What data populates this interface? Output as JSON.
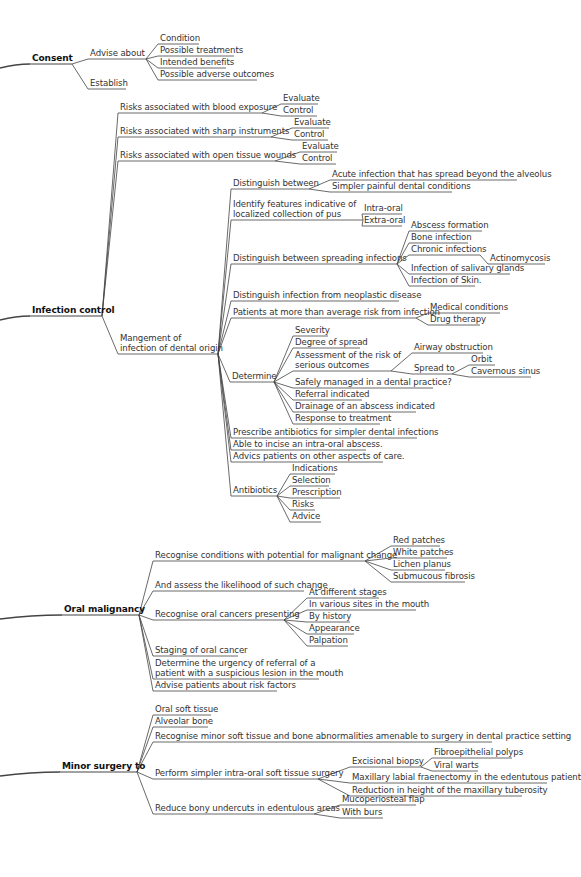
{
  "diagram": {
    "type": "mind-map",
    "colors": {
      "line": "#444444",
      "text": "#333333",
      "root_text": "#111111",
      "background": "#ffffff"
    },
    "nodes": [
      {
        "id": "consent",
        "text": "Consent",
        "x": 32,
        "y": 64,
        "w": 36,
        "root": true,
        "parent": null
      },
      {
        "id": "advise",
        "text": "Advise about",
        "x": 90,
        "y": 59,
        "w": 52,
        "parent": "consent"
      },
      {
        "id": "establish",
        "text": "Establish",
        "x": 90,
        "y": 89,
        "w": 32,
        "parent": "consent"
      },
      {
        "id": "cond",
        "text": "Condition",
        "x": 160,
        "y": 44,
        "w": 35,
        "parent": "advise"
      },
      {
        "id": "treat",
        "text": "Possible treatments",
        "x": 160,
        "y": 56,
        "w": 70,
        "parent": "advise"
      },
      {
        "id": "bene",
        "text": "Intended benefits",
        "x": 160,
        "y": 68,
        "w": 62,
        "parent": "advise"
      },
      {
        "id": "adv",
        "text": "Possible adverse outcomes",
        "x": 160,
        "y": 80,
        "w": 93,
        "parent": "advise"
      },
      {
        "id": "ic",
        "text": "Infection control",
        "x": 32,
        "y": 316,
        "w": 66,
        "root": true,
        "parent": null
      },
      {
        "id": "blood",
        "text": "Risks associated with blood exposure",
        "x": 120,
        "y": 113,
        "w": 138,
        "parent": "ic"
      },
      {
        "id": "blood_e",
        "text": "Evaluate",
        "x": 283,
        "y": 104,
        "w": 31,
        "parent": "blood"
      },
      {
        "id": "blood_c",
        "text": "Control",
        "x": 283,
        "y": 116,
        "w": 30,
        "parent": "blood"
      },
      {
        "id": "sharp",
        "text": "Risks associated with sharp instruments",
        "x": 120,
        "y": 137,
        "w": 147,
        "parent": "ic"
      },
      {
        "id": "sharp_e",
        "text": "Evaluate",
        "x": 294,
        "y": 128,
        "w": 31,
        "parent": "sharp"
      },
      {
        "id": "sharp_c",
        "text": "Control",
        "x": 294,
        "y": 140,
        "w": 30,
        "parent": "sharp"
      },
      {
        "id": "open",
        "text": "Risks associated with open tissue wounds",
        "x": 120,
        "y": 161,
        "w": 151,
        "parent": "ic"
      },
      {
        "id": "open_e",
        "text": "Evaluate",
        "x": 302,
        "y": 152,
        "w": 31,
        "parent": "open"
      },
      {
        "id": "open_c",
        "text": "Control",
        "x": 302,
        "y": 164,
        "w": 30,
        "parent": "open"
      },
      {
        "id": "mgmt",
        "text": "Mangement of\ninfection of dental origin",
        "x": 120,
        "y": 354,
        "w": 94,
        "parent": "ic",
        "lines": 2
      },
      {
        "id": "dist",
        "text": "Distinguish between",
        "x": 233,
        "y": 189,
        "w": 72,
        "parent": "mgmt"
      },
      {
        "id": "acute",
        "text": "Acute infection that has spread beyond the alveolus",
        "x": 332,
        "y": 180,
        "w": 181,
        "parent": "dist"
      },
      {
        "id": "simpler",
        "text": "Simpler painful dental conditions",
        "x": 332,
        "y": 192,
        "w": 116,
        "parent": "dist"
      },
      {
        "id": "ident",
        "text": "Identify features indicative of\nlocalized collection of pus",
        "x": 233,
        "y": 220,
        "w": 126,
        "parent": "mgmt",
        "lines": 2
      },
      {
        "id": "intra",
        "text": "Intra-oral",
        "x": 364,
        "y": 214,
        "w": 34,
        "parent": "ident"
      },
      {
        "id": "extra",
        "text": "Extra-oral",
        "x": 364,
        "y": 226,
        "w": 34,
        "parent": "ident"
      },
      {
        "id": "spread",
        "text": "Distinguish between spreading infections",
        "x": 233,
        "y": 264,
        "w": 160,
        "parent": "mgmt"
      },
      {
        "id": "absc",
        "text": "Abscess formation",
        "x": 411,
        "y": 231,
        "w": 67,
        "parent": "spread"
      },
      {
        "id": "bone",
        "text": "Bone infection",
        "x": 411,
        "y": 243,
        "w": 53,
        "parent": "spread"
      },
      {
        "id": "chronic",
        "text": "Chronic infections",
        "x": 411,
        "y": 255,
        "w": 65,
        "parent": "spread"
      },
      {
        "id": "actino",
        "text": "Actinomycosis",
        "x": 490,
        "y": 264,
        "w": 51,
        "parent": "chronic"
      },
      {
        "id": "saliv",
        "text": "Infection of salivary glands",
        "x": 411,
        "y": 274,
        "w": 95,
        "parent": "spread"
      },
      {
        "id": "skin",
        "text": "Infection of Skin.",
        "x": 411,
        "y": 286,
        "w": 60,
        "parent": "spread"
      },
      {
        "id": "neo",
        "text": "Distinguish infection from neoplastic disease",
        "x": 233,
        "y": 301,
        "w": 162,
        "parent": "mgmt"
      },
      {
        "id": "risk",
        "text": "Patients at more than average risk from infection",
        "x": 233,
        "y": 318,
        "w": 179,
        "parent": "mgmt"
      },
      {
        "id": "med",
        "text": "Medical conditions",
        "x": 430,
        "y": 313,
        "w": 66,
        "parent": "risk"
      },
      {
        "id": "drug",
        "text": "Drug therapy",
        "x": 430,
        "y": 325,
        "w": 46,
        "parent": "risk"
      },
      {
        "id": "determ",
        "text": "Determine",
        "x": 232,
        "y": 382,
        "w": 38,
        "parent": "mgmt"
      },
      {
        "id": "sev",
        "text": "Severity",
        "x": 295,
        "y": 336,
        "w": 29,
        "parent": "determ"
      },
      {
        "id": "deg",
        "text": "Degree of spread",
        "x": 295,
        "y": 348,
        "w": 61,
        "parent": "determ"
      },
      {
        "id": "assess",
        "text": "Assessment of the risk of\nserious outcomes",
        "x": 295,
        "y": 371,
        "w": 92,
        "parent": "determ",
        "lines": 2
      },
      {
        "id": "airway",
        "text": "Airway obstruction",
        "x": 414,
        "y": 353,
        "w": 65,
        "parent": "assess"
      },
      {
        "id": "spreadto",
        "text": "Spread to",
        "x": 414,
        "y": 374,
        "w": 34,
        "parent": "assess"
      },
      {
        "id": "orbit",
        "text": "Orbit",
        "x": 471,
        "y": 365,
        "w": 20,
        "parent": "spreadto"
      },
      {
        "id": "cav",
        "text": "Cavernous sinus",
        "x": 471,
        "y": 377,
        "w": 56,
        "parent": "spreadto"
      },
      {
        "id": "safe",
        "text": "Safely managed in a dental practice?",
        "x": 295,
        "y": 388,
        "w": 134,
        "parent": "determ"
      },
      {
        "id": "refer",
        "text": "Referral indicated",
        "x": 295,
        "y": 400,
        "w": 63,
        "parent": "determ"
      },
      {
        "id": "drain",
        "text": "Drainage of an abscess indicated",
        "x": 295,
        "y": 412,
        "w": 117,
        "parent": "determ"
      },
      {
        "id": "resp",
        "text": "Response to treatment",
        "x": 295,
        "y": 424,
        "w": 81,
        "parent": "determ"
      },
      {
        "id": "presc",
        "text": "Prescribe antibiotics for simpler dental infections",
        "x": 233,
        "y": 438,
        "w": 180,
        "parent": "mgmt"
      },
      {
        "id": "incise",
        "text": "Able to incise an intra-oral abscess.",
        "x": 233,
        "y": 450,
        "w": 129,
        "parent": "mgmt"
      },
      {
        "id": "advice_c",
        "text": "Advics patients on other aspects of care.",
        "x": 233,
        "y": 462,
        "w": 146,
        "parent": "mgmt"
      },
      {
        "id": "antib",
        "text": "Antibiotics",
        "x": 233,
        "y": 496,
        "w": 40,
        "parent": "mgmt"
      },
      {
        "id": "ind",
        "text": "Indications",
        "x": 292,
        "y": 474,
        "w": 39,
        "parent": "antib"
      },
      {
        "id": "sel",
        "text": "Selection",
        "x": 292,
        "y": 486,
        "w": 33,
        "parent": "antib"
      },
      {
        "id": "pres2",
        "text": "Prescription",
        "x": 292,
        "y": 498,
        "w": 44,
        "parent": "antib"
      },
      {
        "id": "risks",
        "text": "Risks",
        "x": 292,
        "y": 510,
        "w": 19,
        "parent": "antib"
      },
      {
        "id": "advi",
        "text": "Advice",
        "x": 292,
        "y": 522,
        "w": 25,
        "parent": "antib"
      },
      {
        "id": "om",
        "text": "Oral malignancy",
        "x": 64,
        "y": 615,
        "w": 71,
        "root": true,
        "parent": null
      },
      {
        "id": "recog",
        "text": "Recognise conditions with potential for malignant change",
        "x": 155,
        "y": 561,
        "w": 206,
        "parent": "om"
      },
      {
        "id": "red",
        "text": "Red patches",
        "x": 393,
        "y": 546,
        "w": 43,
        "parent": "recog"
      },
      {
        "id": "white",
        "text": "White patches",
        "x": 393,
        "y": 558,
        "w": 50,
        "parent": "recog"
      },
      {
        "id": "lichen",
        "text": "Lichen planus",
        "x": 393,
        "y": 570,
        "w": 48,
        "parent": "recog"
      },
      {
        "id": "submuc",
        "text": "Submucous fibrosis",
        "x": 393,
        "y": 582,
        "w": 68,
        "parent": "recog"
      },
      {
        "id": "likeli",
        "text": "And assess the likelihood of such change",
        "x": 155,
        "y": 591,
        "w": 145,
        "parent": "om"
      },
      {
        "id": "recogcan",
        "text": "Recognise oral cancers presenting",
        "x": 155,
        "y": 620,
        "w": 125,
        "parent": "om"
      },
      {
        "id": "stages",
        "text": "At different stages",
        "x": 309,
        "y": 598,
        "w": 66,
        "parent": "recogcan"
      },
      {
        "id": "sites",
        "text": "In various sites in the mouth",
        "x": 309,
        "y": 610,
        "w": 103,
        "parent": "recogcan"
      },
      {
        "id": "hist",
        "text": "By history",
        "x": 309,
        "y": 622,
        "w": 37,
        "parent": "recogcan"
      },
      {
        "id": "appear",
        "text": "Appearance",
        "x": 309,
        "y": 634,
        "w": 41,
        "parent": "recogcan"
      },
      {
        "id": "palp",
        "text": "Palpation",
        "x": 309,
        "y": 646,
        "w": 35,
        "parent": "recogcan"
      },
      {
        "id": "staging",
        "text": "Staging of oral cancer",
        "x": 155,
        "y": 656,
        "w": 79,
        "parent": "om"
      },
      {
        "id": "urgency",
        "text": "Determine the urgency of referral of a\npatient with a suspicious lesion in the mouth",
        "x": 155,
        "y": 679,
        "w": 160,
        "parent": "om",
        "lines": 2
      },
      {
        "id": "riskf",
        "text": "Advise patients about risk factors",
        "x": 155,
        "y": 691,
        "w": 118,
        "parent": "om"
      },
      {
        "id": "ms",
        "text": "Minor surgery to",
        "x": 62,
        "y": 772,
        "w": 71,
        "root": true,
        "parent": null
      },
      {
        "id": "ost",
        "text": "Oral soft tissue",
        "x": 155,
        "y": 715,
        "w": 52,
        "parent": "ms"
      },
      {
        "id": "alv",
        "text": "Alveolar bone",
        "x": 155,
        "y": 727,
        "w": 49,
        "parent": "ms"
      },
      {
        "id": "recmin",
        "text": "Recognise minor soft tissue and bone abnormalities amenable to surgery in dental practice setting",
        "x": 155,
        "y": 742,
        "w": 333,
        "parent": "ms"
      },
      {
        "id": "perf",
        "text": "Perform simpler intra-oral soft tissue surgery",
        "x": 155,
        "y": 779,
        "w": 159,
        "parent": "ms"
      },
      {
        "id": "exc",
        "text": "Excisional biopsy",
        "x": 352,
        "y": 767,
        "w": 65,
        "parent": "perf"
      },
      {
        "id": "fibro",
        "text": "Fibroepithelial polyps",
        "x": 434,
        "y": 758,
        "w": 74,
        "parent": "exc"
      },
      {
        "id": "warts",
        "text": "Viral warts",
        "x": 434,
        "y": 771,
        "w": 40,
        "parent": "exc"
      },
      {
        "id": "maxlab",
        "text": "Maxillary labial fraenectomy in the edentutous patient",
        "x": 352,
        "y": 783,
        "w": 191,
        "parent": "perf"
      },
      {
        "id": "reduc",
        "text": "Reduction in height of the maxillary tuberosity",
        "x": 352,
        "y": 796,
        "w": 166,
        "parent": "perf"
      },
      {
        "id": "undercut",
        "text": "Reduce bony undercuts in edentulous areas",
        "x": 155,
        "y": 814,
        "w": 155,
        "parent": "ms"
      },
      {
        "id": "mucop",
        "text": "Mucoperiosteal flap",
        "x": 342,
        "y": 805,
        "w": 70,
        "parent": "undercut"
      },
      {
        "id": "burs",
        "text": "With burs",
        "x": 342,
        "y": 818,
        "w": 37,
        "parent": "undercut"
      }
    ]
  }
}
